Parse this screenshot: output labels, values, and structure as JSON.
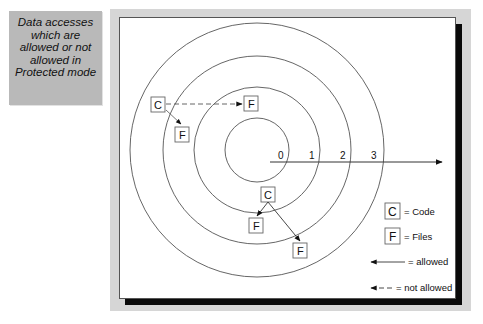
{
  "caption": {
    "lines": [
      "Data accesses",
      "which are",
      "allowed or not",
      "allowed in",
      "Protected mode"
    ]
  },
  "diagram": {
    "ring_labels": [
      "0",
      "1",
      "2",
      "3"
    ],
    "nodes": {
      "ring3_code": "C",
      "ring3_file_inner": "F",
      "ring3_file_outer": "F",
      "ring1_code": "C",
      "ring1_file_inner": "F",
      "ring1_file_outer": "F"
    },
    "legend": {
      "code_glyph": "C",
      "code_label": "= Code",
      "files_glyph": "F",
      "files_label": "= Files",
      "allowed_label": "= allowed",
      "not_allowed_label": "= not allowed"
    },
    "colors": {
      "caption_bg": "#b9b9b9",
      "frame_bg": "#d6d6d6",
      "shadow": "#0a0a0a",
      "lines": "#444444"
    }
  }
}
